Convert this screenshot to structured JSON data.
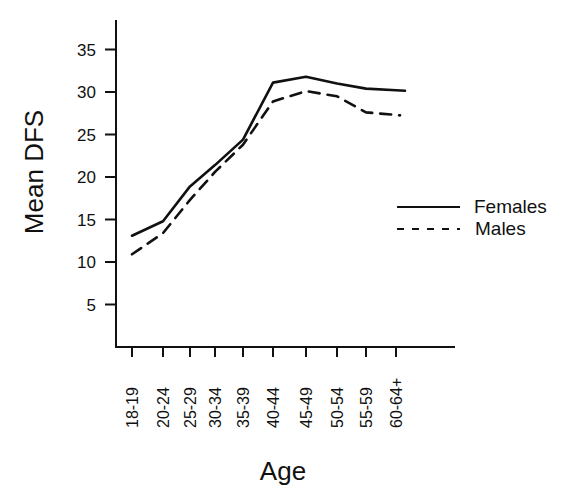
{
  "chart_data": {
    "type": "line",
    "title": "",
    "xlabel": "Age",
    "ylabel": "Mean DFS",
    "categories": [
      "18-19",
      "20-24",
      "25-29",
      "30-34",
      "35-39",
      "40-44",
      "45-49",
      "50-54",
      "55-59",
      "60-64+"
    ],
    "series": [
      {
        "name": "Females",
        "style": "solid",
        "values": [
          13.1,
          14.8,
          18.9,
          21.4,
          24.4,
          31.1,
          31.8,
          31.0,
          30.4,
          30.2
        ]
      },
      {
        "name": "Males",
        "style": "dashed",
        "values": [
          10.9,
          13.4,
          17.3,
          20.6,
          23.8,
          28.9,
          30.1,
          29.5,
          27.6,
          27.3
        ]
      }
    ],
    "yticks": [
      5,
      10,
      15,
      20,
      25,
      30,
      35
    ],
    "ylim": [
      0,
      38
    ],
    "grid": false,
    "legend_position": "right"
  },
  "legend": {
    "females_label": "Females",
    "males_label": "Males"
  },
  "axes": {
    "x_title": "Age",
    "y_title": "Mean DFS"
  },
  "colors": {
    "line": "#111111",
    "background": "#ffffff"
  }
}
